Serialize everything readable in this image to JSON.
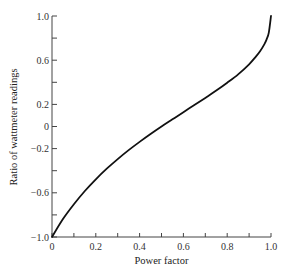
{
  "chart_data": {
    "type": "line",
    "title": "",
    "xlabel": "Power factor",
    "ylabel": "Ratio of wattmeter readings",
    "xlim": [
      0,
      1.0
    ],
    "ylim": [
      -1.0,
      1.0
    ],
    "grid": false,
    "legend": null,
    "x_ticks": [
      0,
      0.1,
      0.2,
      0.3,
      0.4,
      0.5,
      0.6,
      0.7,
      0.8,
      0.9,
      1.0
    ],
    "x_tick_labels": [
      {
        "value": 0,
        "label": "0"
      },
      {
        "value": 0.2,
        "label": "0.2"
      },
      {
        "value": 0.4,
        "label": "0.4"
      },
      {
        "value": 0.6,
        "label": "0.6"
      },
      {
        "value": 0.8,
        "label": "0.8"
      },
      {
        "value": 1.0,
        "label": "1.0"
      }
    ],
    "y_ticks": [
      -1.0,
      -0.8,
      -0.6,
      -0.4,
      -0.2,
      0,
      0.2,
      0.4,
      0.6,
      0.8,
      1.0
    ],
    "y_tick_labels": [
      {
        "value": 1.0,
        "label": "1.0"
      },
      {
        "value": 0.6,
        "label": "0.6"
      },
      {
        "value": 0.2,
        "label": "0.2"
      },
      {
        "value": 0,
        "label": "0"
      },
      {
        "value": -0.2,
        "label": "−0.2"
      },
      {
        "value": -0.6,
        "label": "−0.6"
      },
      {
        "value": -1.0,
        "label": "−1.0"
      }
    ],
    "series": [
      {
        "name": "Ratio of wattmeter readings",
        "color": "#111111",
        "x": [
          0,
          0.05,
          0.1,
          0.15,
          0.2,
          0.25,
          0.3,
          0.35,
          0.4,
          0.45,
          0.5,
          0.55,
          0.6,
          0.65,
          0.7,
          0.75,
          0.8,
          0.85,
          0.9,
          0.93,
          0.95,
          0.97,
          0.98,
          0.99,
          1.0
        ],
        "values": [
          -1.0,
          -0.838,
          -0.704,
          -0.584,
          -0.478,
          -0.382,
          -0.295,
          -0.214,
          -0.139,
          -0.068,
          0.0,
          0.065,
          0.13,
          0.194,
          0.259,
          0.325,
          0.396,
          0.472,
          0.563,
          0.63,
          0.681,
          0.746,
          0.789,
          0.849,
          1.0
        ]
      }
    ]
  }
}
